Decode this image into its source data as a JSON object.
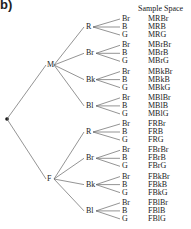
{
  "part_label": "b)",
  "header": "Sample Space",
  "root": {
    "label": ""
  },
  "levels": [
    {
      "label": "M",
      "children": [
        {
          "label": "R",
          "leaves": [
            "Br",
            "B",
            "G"
          ],
          "outcomes": [
            "MRBr",
            "MRB",
            "MRG"
          ]
        },
        {
          "label": "Br",
          "leaves": [
            "Br",
            "B",
            "G"
          ],
          "outcomes": [
            "MBrBr",
            "MBrB",
            "MBrG"
          ]
        },
        {
          "label": "Bk",
          "leaves": [
            "Br",
            "B",
            "G"
          ],
          "outcomes": [
            "MBkBr",
            "MBkB",
            "MBkG"
          ]
        },
        {
          "label": "Bl",
          "leaves": [
            "Br",
            "B",
            "G"
          ],
          "outcomes": [
            "MBlBr",
            "MBlB",
            "MBlG"
          ]
        }
      ]
    },
    {
      "label": "F",
      "children": [
        {
          "label": "R",
          "leaves": [
            "Br",
            "B",
            "G"
          ],
          "outcomes": [
            "FRBr",
            "FRB",
            "FRG"
          ]
        },
        {
          "label": "Br",
          "leaves": [
            "Br",
            "B",
            "G"
          ],
          "outcomes": [
            "FBrBr",
            "FBrB",
            "FBrG"
          ]
        },
        {
          "label": "Bk",
          "leaves": [
            "Br",
            "B",
            "G"
          ],
          "outcomes": [
            "FBkBr",
            "FBkB",
            "FBkG"
          ]
        },
        {
          "label": "Bl",
          "leaves": [
            "Br",
            "B",
            "G"
          ],
          "outcomes": [
            "FBlBr",
            "FBlB",
            "FBlG"
          ]
        }
      ]
    }
  ]
}
